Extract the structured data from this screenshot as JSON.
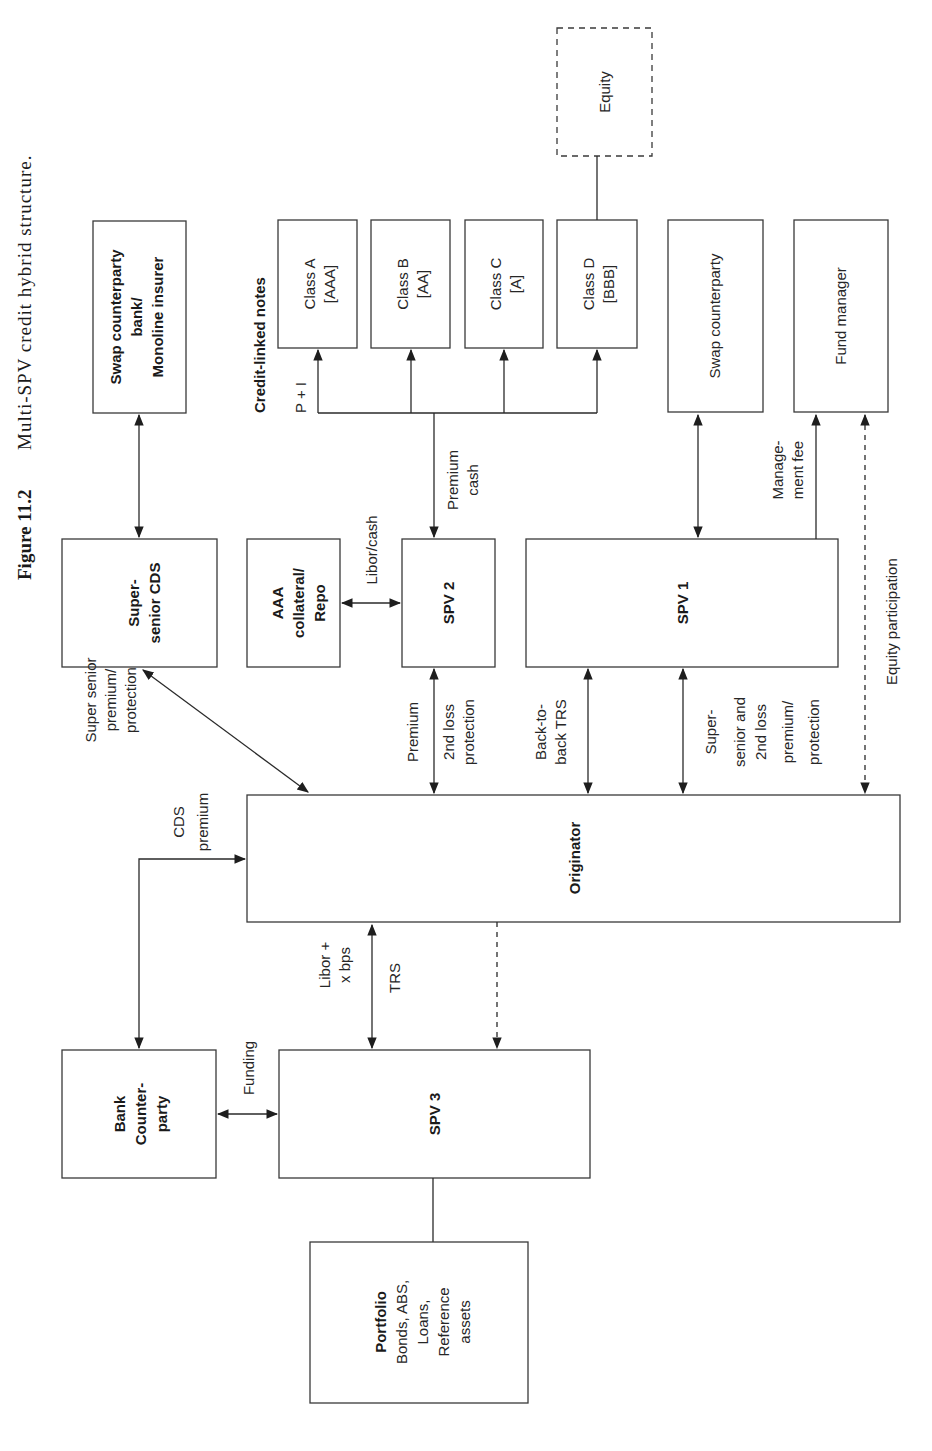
{
  "figure": {
    "number": "Figure 11.2",
    "caption": "Multi-SPV credit hybrid structure.",
    "orientation": "rotated 90° counter-clockwise"
  },
  "nodes": {
    "swap_monoline": {
      "lines": [
        "Swap counterparty",
        "bank/",
        "Monoline insurer"
      ],
      "bold": true
    },
    "cln_heading": "Credit-linked notes",
    "class_a": {
      "lines": [
        "Class A",
        "[AAA]"
      ]
    },
    "class_b": {
      "lines": [
        "Class B",
        "[AA]"
      ]
    },
    "class_c": {
      "lines": [
        "Class C",
        "[A]"
      ]
    },
    "class_d": {
      "lines": [
        "Class D",
        "[BBB]"
      ]
    },
    "equity": {
      "lines": [
        "Equity"
      ],
      "style": "dashed"
    },
    "swap_counterparty": {
      "lines": [
        "Swap counterparty"
      ]
    },
    "fund_manager": {
      "lines": [
        "Fund manager"
      ]
    },
    "super_senior_cds": {
      "lines": [
        "Super-",
        "senior CDS"
      ],
      "bold": true
    },
    "aaa_collateral": {
      "lines": [
        "AAA",
        "collateral/",
        "Repo"
      ],
      "bold": true
    },
    "spv2": {
      "lines": [
        "SPV 2"
      ],
      "bold": true
    },
    "spv1": {
      "lines": [
        "SPV 1"
      ],
      "bold": true
    },
    "originator": {
      "lines": [
        "Originator"
      ],
      "bold": true
    },
    "bank_counterparty": {
      "lines": [
        "Bank",
        "Counter-",
        "party"
      ],
      "bold": true
    },
    "spv3": {
      "lines": [
        "SPV 3"
      ],
      "bold": true
    },
    "portfolio": {
      "title": "Portfolio",
      "lines": [
        "Bonds, ABS,",
        "Loans,",
        "Reference",
        "assets"
      ]
    }
  },
  "edge_labels": {
    "p_plus_i": "P + I",
    "premium_cash": [
      "Premium",
      "cash"
    ],
    "libor_cash": "Libor/cash",
    "management_fee": [
      "Manage-",
      "ment fee"
    ],
    "equity_participation": "Equity participation",
    "super_senior_premium": [
      "Super senior",
      "premium/",
      "protection"
    ],
    "cds_premium": [
      "CDS",
      "premium"
    ],
    "spv2_link": [
      "Premium",
      "2nd loss",
      "protection"
    ],
    "back_to_back": [
      "Back-to-",
      "back TRS"
    ],
    "spv1_link": [
      "Super-",
      "senior and",
      "2nd loss",
      "premium/",
      "protection"
    ],
    "libor_bps": [
      "Libor +",
      "x bps"
    ],
    "trs": "TRS",
    "funding": "Funding"
  },
  "colors": {
    "stroke": "#3a3a3a",
    "text": "#262626",
    "background": "#ffffff"
  }
}
